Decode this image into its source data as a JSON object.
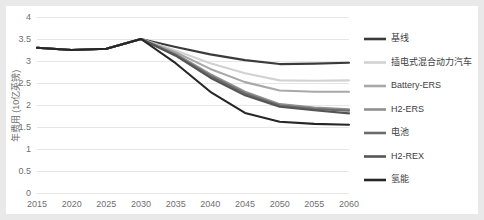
{
  "chart_data": {
    "type": "line",
    "title": "",
    "xlabel": "",
    "ylabel": "年费用 (10亿英镑)",
    "xlim": [
      2015,
      2060
    ],
    "ylim": [
      0,
      4
    ],
    "ytick_step": 0.5,
    "grid": true,
    "legend_position": "right",
    "background": "#ffffff",
    "page_background": "#e9e9e9",
    "gridline_color": "#e6e6e6",
    "tick_color": "#6f6f6f",
    "x": [
      2015,
      2020,
      2025,
      2030,
      2035,
      2040,
      2045,
      2050,
      2055,
      2060
    ],
    "xtick_labels": [
      "2015",
      "2020",
      "2025",
      "2030",
      "2035",
      "2040",
      "2045",
      "2050",
      "2055",
      "2060"
    ],
    "ytick_labels": [
      "0",
      "0.5",
      "1",
      "1.5",
      "2",
      "2.5",
      "3",
      "3.5",
      "4"
    ],
    "ytick_values": [
      0,
      0.5,
      1,
      1.5,
      2,
      2.5,
      3,
      3.5,
      4
    ],
    "series": [
      {
        "name": "基线",
        "color": "#3a3a3a",
        "values": [
          3.3,
          3.25,
          3.28,
          3.5,
          3.32,
          3.15,
          3.02,
          2.93,
          2.94,
          2.96
        ]
      },
      {
        "name": "插电式混合动力汽车",
        "color": "#d2d2d2",
        "values": [
          3.3,
          3.25,
          3.28,
          3.5,
          3.24,
          2.95,
          2.72,
          2.56,
          2.55,
          2.56
        ]
      },
      {
        "name": "Battery-ERS",
        "color": "#a8a8a8",
        "values": [
          3.3,
          3.25,
          3.28,
          3.5,
          3.2,
          2.82,
          2.52,
          2.33,
          2.3,
          2.3
        ]
      },
      {
        "name": "H2-ERS",
        "color": "#8f8f8f",
        "values": [
          3.3,
          3.25,
          3.28,
          3.5,
          3.16,
          2.7,
          2.3,
          2.02,
          1.94,
          1.9
        ]
      },
      {
        "name": "电池",
        "color": "#6b6b6b",
        "values": [
          3.3,
          3.25,
          3.28,
          3.5,
          3.14,
          2.66,
          2.26,
          1.99,
          1.91,
          1.87
        ]
      },
      {
        "name": "H2-REX",
        "color": "#555555",
        "values": [
          3.3,
          3.25,
          3.28,
          3.5,
          3.12,
          2.62,
          2.22,
          1.96,
          1.88,
          1.81
        ]
      },
      {
        "name": "氢能",
        "color": "#262626",
        "values": [
          3.3,
          3.25,
          3.28,
          3.5,
          2.95,
          2.3,
          1.82,
          1.62,
          1.57,
          1.55
        ]
      }
    ]
  }
}
